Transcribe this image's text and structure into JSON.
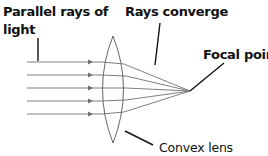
{
  "diagram": {
    "labels": {
      "parallel_rays_line1": "Parallel rays of",
      "parallel_rays_line2": "light",
      "rays_converge": "Rays converge",
      "focal_point": "Focal point",
      "convex_lens": "Convex lens"
    },
    "rays": {
      "count": 5,
      "y_positions": [
        62,
        75,
        88,
        101,
        114
      ]
    },
    "colors": {
      "ray": "#6e6e6e",
      "lens": "#555555",
      "leader": "#111111",
      "text": "#111111"
    }
  }
}
